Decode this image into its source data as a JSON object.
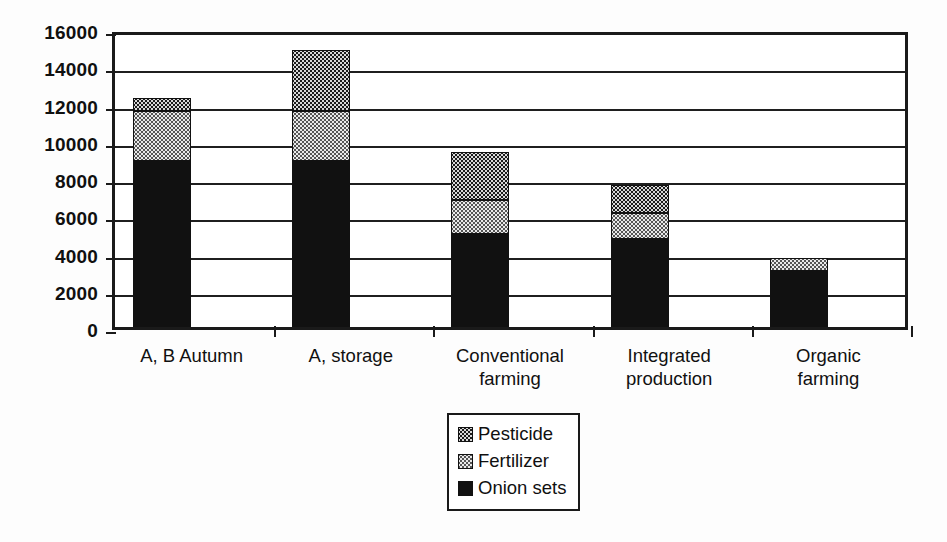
{
  "chart_data": {
    "type": "bar",
    "subtype": "stacked-vertical",
    "title": "",
    "xlabel": "",
    "ylabel": "",
    "ylim": [
      0,
      16000
    ],
    "ytick_step": 2000,
    "yticks": [
      0,
      2000,
      4000,
      6000,
      8000,
      10000,
      12000,
      14000,
      16000
    ],
    "ytick_labels": [
      "0",
      "2000",
      "4000",
      "6000",
      "8000",
      "10000",
      "12000",
      "14000",
      "16000"
    ],
    "grid": true,
    "grid_axis": "y",
    "legend_position": "bottom-center",
    "categories": [
      "A, B Autumn",
      "A, storage",
      "Conventional farming",
      "Integrated production",
      "Organic farming"
    ],
    "category_lines": [
      [
        "A, B Autumn"
      ],
      [
        "A, storage"
      ],
      [
        "Conventional",
        "farming"
      ],
      [
        "Integrated",
        "production"
      ],
      [
        "Organic",
        "farming"
      ]
    ],
    "series": [
      {
        "name": "Onion sets",
        "pattern": "solid-black",
        "color": "#111111",
        "values": [
          8900,
          8900,
          5000,
          4700,
          3000
        ]
      },
      {
        "name": "Fertilizer",
        "pattern": "light-dotted",
        "color": "#e9e9e9",
        "values": [
          2700,
          2700,
          1800,
          1400,
          700
        ]
      },
      {
        "name": "Pesticide",
        "pattern": "dark-checkered",
        "color": "#1b1b1b",
        "values": [
          700,
          3300,
          2600,
          1500,
          0
        ]
      }
    ],
    "stack_order_bottom_to_top": [
      "Onion sets",
      "Fertilizer",
      "Pesticide"
    ],
    "totals": [
      12300,
      14900,
      9400,
      7600,
      3700
    ]
  },
  "legend": {
    "entries": [
      {
        "label": "Pesticide",
        "pattern": "dark-checkered"
      },
      {
        "label": "Fertilizer",
        "pattern": "light-dotted"
      },
      {
        "label": "Onion sets",
        "pattern": "solid-black"
      }
    ]
  }
}
